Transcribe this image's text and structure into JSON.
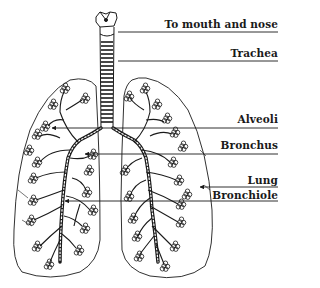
{
  "colors": {
    "ink": "#1a1a1a",
    "background": "#ffffff"
  },
  "labels": [
    {
      "id": "mouth",
      "text": "To mouth and nose",
      "line_y": 32,
      "x1": 118,
      "text_top": 19
    },
    {
      "id": "trachea",
      "text": "Trachea",
      "line_y": 61,
      "x1": 118,
      "text_top": 48
    },
    {
      "id": "alveoli",
      "text": "Alveoli",
      "line_y": 128,
      "x1": 52,
      "text_top": 114
    },
    {
      "id": "bronchus",
      "text": "Bronchus",
      "line_y": 154,
      "x1": 85,
      "text_top": 140
    },
    {
      "id": "lung",
      "text": "Lung",
      "line_y": 187,
      "x1": 200,
      "text_top": 175
    },
    {
      "id": "bronchiole",
      "text": "Bronchiole",
      "line_y": 201,
      "x1": 65,
      "text_top": 190
    }
  ]
}
